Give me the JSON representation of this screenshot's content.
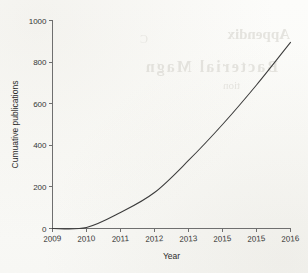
{
  "figure": {
    "background_color": "#fdfdfb",
    "curve_color": "#3b3b3b",
    "axis_color": "#6f6f6f",
    "bleed_through": {
      "line1": "Appendix",
      "line2": "Bacterial Magn",
      "line3": "tion",
      "line4": "C"
    }
  },
  "chart_data": {
    "type": "line",
    "title": "",
    "subtitle": "",
    "xlabel": "Year",
    "ylabel": "Cumuative publications",
    "x_tick_labels": [
      "2009",
      "2010",
      "2011",
      "2012",
      "2013",
      "2015",
      "2015",
      "2016"
    ],
    "x_values": [
      2009,
      2010,
      2011,
      2012,
      2013,
      2014,
      2015,
      2016
    ],
    "y_tick_labels": [
      "0",
      "200",
      "400",
      "600",
      "800",
      "1000"
    ],
    "y_ticks": [
      0,
      200,
      400,
      600,
      800,
      1000
    ],
    "xlim": [
      2009,
      2016
    ],
    "ylim": [
      0,
      1000
    ],
    "grid": false,
    "legend": false,
    "series": [
      {
        "name": "Cumulative publications",
        "values": [
          0,
          5,
          77,
          173,
          327,
          500,
          690,
          895
        ]
      }
    ],
    "annotations": [],
    "notes": {
      "ylabel_as_printed": "Cumuative publications",
      "x_tick_misprint": "sixth tick prints 2015 where 2014 is expected"
    }
  }
}
